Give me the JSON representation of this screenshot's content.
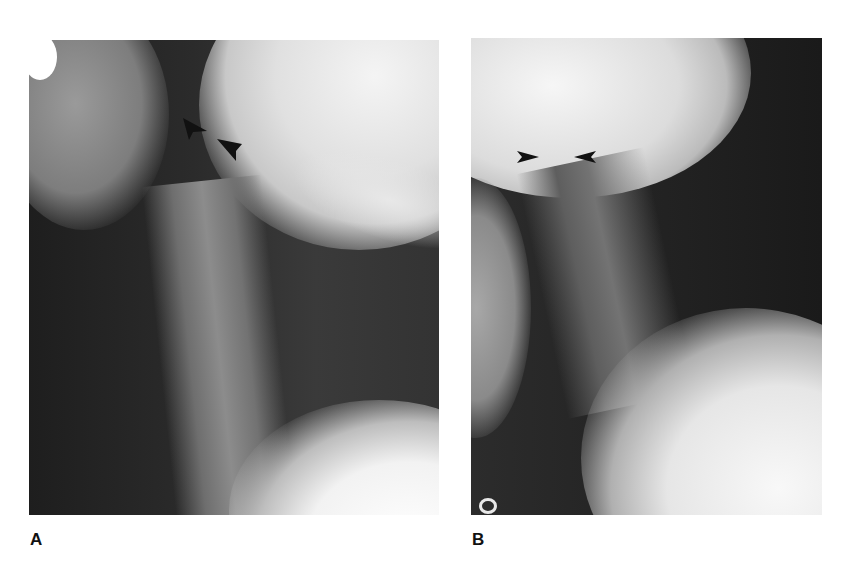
{
  "figure": {
    "panels": [
      {
        "id": "A",
        "label": "A",
        "description": "Lateral cervical spine radiograph",
        "markers": [
          {
            "type": "arrowhead",
            "x": 196,
            "y": 125,
            "direction": "right-down"
          },
          {
            "type": "arrowhead",
            "x": 232,
            "y": 147,
            "direction": "right-down"
          }
        ]
      },
      {
        "id": "B",
        "label": "B",
        "description": "Lateral cervical spine radiograph",
        "markers": [
          {
            "type": "arrowhead",
            "x": 527,
            "y": 158,
            "direction": "right"
          },
          {
            "type": "arrowhead",
            "x": 585,
            "y": 158,
            "direction": "left"
          }
        ]
      }
    ]
  }
}
